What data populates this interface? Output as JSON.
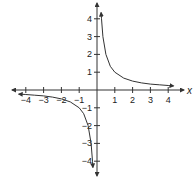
{
  "chart_data": {
    "type": "line",
    "title": "",
    "function": "y = 1/x",
    "xlabel": "x",
    "ylabel": "",
    "xlim": [
      -4.5,
      4.5
    ],
    "ylim": [
      -4.5,
      4.5
    ],
    "grid": false,
    "legend": null,
    "x_ticks": [
      -4,
      -3,
      -2,
      -1,
      1,
      2,
      3,
      4
    ],
    "y_ticks": [
      4,
      3,
      2,
      1,
      -1,
      -2,
      -3,
      -4
    ],
    "x_tick_labels": [
      "-4",
      "-3",
      "-2",
      "-1",
      "1",
      "2",
      "3",
      "4"
    ],
    "y_tick_labels": [
      "4",
      "3",
      "2",
      "1",
      "-1",
      "-2",
      "-3",
      "-4"
    ],
    "series": [
      {
        "name": "branch-positive",
        "x": [
          0.23,
          0.25,
          0.33,
          0.5,
          0.75,
          1,
          1.5,
          2,
          2.5,
          3,
          3.5,
          4,
          4.3
        ],
        "y": [
          4.35,
          4,
          3,
          2,
          1.33,
          1,
          0.67,
          0.5,
          0.4,
          0.33,
          0.29,
          0.25,
          0.23
        ]
      },
      {
        "name": "branch-negative",
        "x": [
          -4.4,
          -4,
          -3.5,
          -3,
          -2.5,
          -2,
          -1.5,
          -1,
          -0.75,
          -0.5,
          -0.33,
          -0.25,
          -0.23
        ],
        "y": [
          -0.23,
          -0.25,
          -0.29,
          -0.33,
          -0.4,
          -0.5,
          -0.67,
          -1,
          -1.33,
          -2,
          -3,
          -4,
          -4.35
        ]
      }
    ],
    "colors": {
      "axis": "#333333",
      "curve": "#333333"
    }
  },
  "labels": {
    "x_axis_label": "x",
    "x_ticks": [
      "-4",
      "-3",
      "-2",
      "-1",
      "1",
      "2",
      "3",
      "4"
    ],
    "y_ticks": [
      "4",
      "3",
      "2",
      "1",
      "-1",
      "-2",
      "-3",
      "-4"
    ]
  }
}
